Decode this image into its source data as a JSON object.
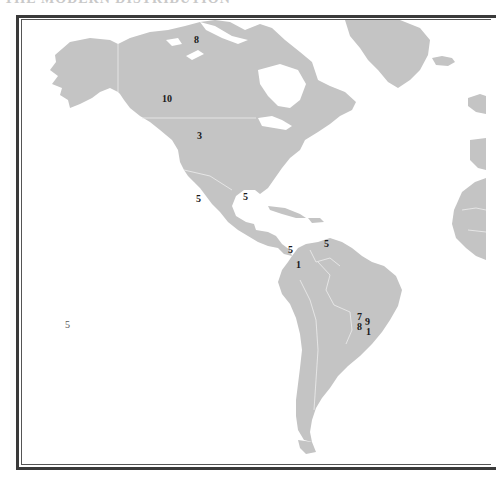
{
  "map": {
    "title_partial": "THE MODERN DISTRIBUTION",
    "land_color": "#c4c4c4",
    "water_color": "#ffffff",
    "border_color": "#eeeeee",
    "frame_color": "#3a3a3a",
    "region": "Americas",
    "labels": [
      {
        "id": "canada-north",
        "value": "8",
        "x": 194,
        "y": 35
      },
      {
        "id": "canada-west",
        "value": "10",
        "x": 162,
        "y": 94
      },
      {
        "id": "usa-north",
        "value": "3",
        "x": 197,
        "y": 131
      },
      {
        "id": "baja-california",
        "value": "5",
        "x": 196,
        "y": 194
      },
      {
        "id": "gulf-of-mexico",
        "value": "5",
        "x": 243,
        "y": 192
      },
      {
        "id": "panama",
        "value": "5",
        "x": 288,
        "y": 245
      },
      {
        "id": "venezuela-coast",
        "value": "5",
        "x": 324,
        "y": 239
      },
      {
        "id": "colombia",
        "value": "1",
        "x": 296,
        "y": 260
      },
      {
        "id": "brazil-a",
        "value": "7",
        "x": 358,
        "y": 313
      },
      {
        "id": "brazil-b",
        "value": "9",
        "x": 366,
        "y": 317
      },
      {
        "id": "brazil-c",
        "value": "8",
        "x": 358,
        "y": 322
      },
      {
        "id": "brazil-d",
        "value": "1",
        "x": 367,
        "y": 327
      },
      {
        "id": "pacific-island",
        "value": "5",
        "x": 65,
        "y": 320
      }
    ]
  }
}
